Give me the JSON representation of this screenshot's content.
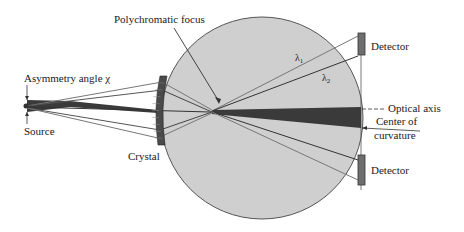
{
  "figure": {
    "type": "spectrometer-schematic",
    "labels": {
      "polychromatic_focus": "Polychromatic focus",
      "asymmetry_angle": "Asymmetry angle χ",
      "source": "Source",
      "crystal": "Crystal",
      "detector_top": "Detector",
      "detector_bottom": "Detector",
      "optical_axis": "Optical axis",
      "center_of_curvature_line1": "Center of",
      "center_of_curvature_line2": "curvature",
      "lambda1": "λ",
      "lambda1_sub": "1",
      "lambda2": "λ",
      "lambda2_sub": "2"
    },
    "colors": {
      "circle_fill": "#cfcfcf",
      "circle_stroke": "#555555",
      "beam_dark": "#3a3a3a",
      "ray_light": "#8a8a8a",
      "crystal_fill": "#4a4a4a",
      "detector_fill": "#6e6e6e",
      "text": "#1a1a1a"
    }
  }
}
